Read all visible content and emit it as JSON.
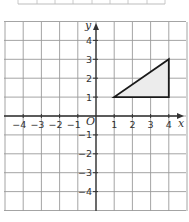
{
  "diagram": {
    "type": "coordinate-grid",
    "x_range": [
      -5,
      5
    ],
    "y_range": [
      -5,
      5
    ],
    "x_axis_label": "x",
    "y_axis_label": "y",
    "origin_label": "O",
    "x_tick_labels": [
      "−4",
      "−3",
      "−2",
      "−1",
      "1",
      "2",
      "3",
      "4"
    ],
    "x_tick_values": [
      -4,
      -3,
      -2,
      -1,
      1,
      2,
      3,
      4
    ],
    "y_tick_labels": [
      "4",
      "3",
      "2",
      "1",
      "−1",
      "−2",
      "−3",
      "−4"
    ],
    "y_tick_values": [
      4,
      3,
      2,
      1,
      -1,
      -2,
      -3,
      -4
    ],
    "shape": {
      "name": "triangle",
      "vertices": [
        [
          1,
          1
        ],
        [
          4,
          1
        ],
        [
          4,
          3
        ]
      ],
      "fill": "#ececec",
      "stroke": "#1a1a1a"
    },
    "colors": {
      "grid": "#9a9a9a",
      "axis": "#333333",
      "top_table_edge": "#bdbdbd"
    }
  }
}
